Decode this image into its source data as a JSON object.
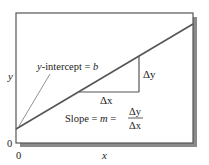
{
  "diagram": {
    "type": "linear-function-graph",
    "axis_labels": {
      "x": "x",
      "y": "y"
    },
    "origin_labels": {
      "x0": "0",
      "y0": "0"
    },
    "intercept_label": {
      "var": "y",
      "text": "-intercept = ",
      "value": "b"
    },
    "delta_x_label": "Δx",
    "delta_y_label": "Δy",
    "slope_label": {
      "prefix": "Slope = ",
      "var": "m",
      "equals": " = ",
      "numerator": "Δy",
      "denominator": "Δx"
    },
    "colors": {
      "line": "#555555",
      "frame": "#444444",
      "shadow": "#888888",
      "text": "#222222"
    }
  }
}
